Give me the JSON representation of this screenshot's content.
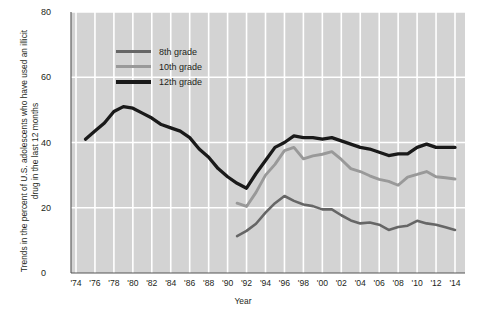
{
  "chart_data": {
    "type": "line",
    "title": "",
    "xlabel": "Year",
    "ylabel": "Trends in the percent of U.S. adolescents who have used an illicit drug in the last 12 months",
    "xlim": [
      1974,
      2014
    ],
    "ylim": [
      0,
      80
    ],
    "ytick_labels": [
      "0",
      "20",
      "40",
      "60",
      "80"
    ],
    "ytick_values": [
      0,
      20,
      40,
      60,
      80
    ],
    "xtick_labels": [
      "'74",
      "'76",
      "'78",
      "'80",
      "'82",
      "'84",
      "'86",
      "'88",
      "'90",
      "'92",
      "'94",
      "'96",
      "'98",
      "'00",
      "'02",
      "'04",
      "'06",
      "'08",
      "'10",
      "'12",
      "'14"
    ],
    "xtick_values": [
      1974,
      1976,
      1978,
      1980,
      1982,
      1984,
      1986,
      1988,
      1990,
      1992,
      1994,
      1996,
      1998,
      2000,
      2002,
      2004,
      2006,
      2008,
      2010,
      2012,
      2014
    ],
    "grid": true,
    "grid_color": "#ffffff",
    "plot_background": "#d3d3d3",
    "legend_position": "upper-left-inside",
    "series": [
      {
        "name": "8th grade",
        "color": "#666666",
        "width": 2.6,
        "x": [
          1991,
          1992,
          1993,
          1994,
          1995,
          1996,
          1997,
          1998,
          1999,
          2000,
          2001,
          2002,
          2003,
          2004,
          2005,
          2006,
          2007,
          2008,
          2009,
          2010,
          2011,
          2012,
          2013,
          2014
        ],
        "y": [
          11.3,
          12.9,
          15.1,
          18.5,
          21.4,
          23.6,
          22.1,
          21.0,
          20.5,
          19.5,
          19.5,
          17.7,
          16.1,
          15.2,
          15.5,
          14.8,
          13.2,
          14.1,
          14.5,
          16.0,
          15.2,
          14.8,
          14.0,
          13.2
        ]
      },
      {
        "name": "10th grade",
        "color": "#999999",
        "width": 2.9,
        "x": [
          1991,
          1992,
          1993,
          1994,
          1995,
          1996,
          1997,
          1998,
          1999,
          2000,
          2001,
          2002,
          2003,
          2004,
          2005,
          2006,
          2007,
          2008,
          2009,
          2010,
          2011,
          2012,
          2013,
          2014
        ],
        "y": [
          21.4,
          20.4,
          24.7,
          30.0,
          33.3,
          37.5,
          38.5,
          35.0,
          35.9,
          36.4,
          37.2,
          34.8,
          32.0,
          31.1,
          29.8,
          28.7,
          28.1,
          26.9,
          29.4,
          30.2,
          31.1,
          29.5,
          29.2,
          28.8
        ]
      },
      {
        "name": "12th grade",
        "color": "#1a1a1a",
        "width": 3.3,
        "x": [
          1975,
          1976,
          1977,
          1978,
          1979,
          1980,
          1981,
          1982,
          1983,
          1984,
          1985,
          1986,
          1987,
          1988,
          1989,
          1990,
          1991,
          1992,
          1993,
          1994,
          1995,
          1996,
          1997,
          1998,
          1999,
          2000,
          2001,
          2002,
          2003,
          2004,
          2005,
          2006,
          2007,
          2008,
          2009,
          2010,
          2011,
          2012,
          2013,
          2014
        ],
        "y": [
          41.0,
          43.5,
          46.0,
          49.5,
          51.0,
          50.5,
          49.0,
          47.5,
          45.5,
          44.5,
          43.5,
          41.5,
          38.0,
          35.5,
          32.0,
          29.5,
          27.5,
          26.0,
          30.5,
          34.5,
          38.5,
          40.0,
          42.0,
          41.5,
          41.5,
          41.0,
          41.5,
          40.5,
          39.5,
          38.5,
          38.0,
          37.0,
          36.0,
          36.5,
          36.5,
          38.5,
          39.5,
          38.5,
          38.5,
          38.5
        ]
      }
    ]
  },
  "legend": {
    "items": [
      {
        "label": "8th grade",
        "color": "#666666"
      },
      {
        "label": "10th grade",
        "color": "#999999"
      },
      {
        "label": "12th grade",
        "color": "#1a1a1a"
      }
    ]
  }
}
